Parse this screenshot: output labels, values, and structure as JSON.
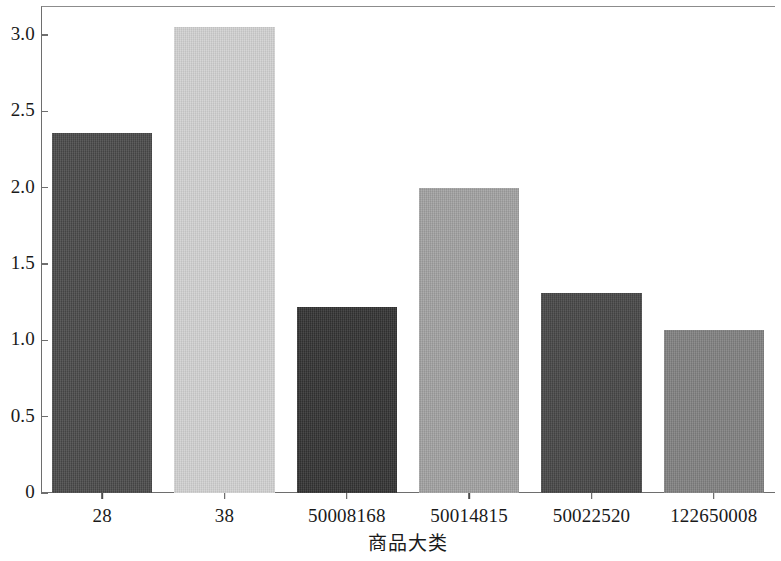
{
  "chart_data": {
    "type": "bar",
    "title": "",
    "subtitle": "",
    "xlabel": "商品大类",
    "ylabel": "",
    "categories": [
      "28",
      "38",
      "50008168",
      "50014815",
      "50022520",
      "122650008"
    ],
    "values": [
      2.36,
      3.05,
      1.22,
      2.0,
      1.31,
      1.07
    ],
    "series": [
      {
        "name": "",
        "values": [
          2.36,
          3.05,
          1.22,
          2.0,
          1.31,
          1.07
        ]
      }
    ],
    "bar_colors": [
      "#4a4a4a",
      "#d2d2d2",
      "#333333",
      "#a2a2a2",
      "#474747",
      "#818181"
    ],
    "ylim": [
      0,
      3.19
    ],
    "ytick_values": [
      0,
      0.5,
      1.0,
      1.5,
      2.0,
      2.5,
      3.0
    ],
    "ytick_labels": [
      "0",
      "0.5",
      "1.0",
      "1.5",
      "2.0",
      "2.5",
      "3.0"
    ],
    "xtick_labels": [
      "28",
      "38",
      "50008168",
      "50014815",
      "50022520",
      "122650008"
    ],
    "grid": false,
    "legend": null,
    "legend_position": "none",
    "annotations": []
  },
  "figure": {
    "background_color": "#ffffff",
    "axis_color": "#6e6e6e",
    "text_color": "#1a1a1a"
  }
}
